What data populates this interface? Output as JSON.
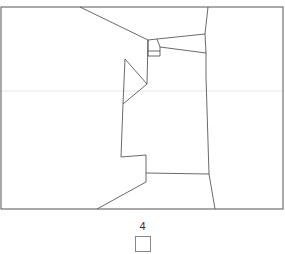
{
  "map": {
    "frame": {
      "x": 1,
      "y": 7,
      "width": 282,
      "height": 202
    },
    "stroke_color": "#444444",
    "gridline": {
      "y": 91,
      "color": "#e8e8e8"
    },
    "boundaries": [
      [
        [
          80,
          7
        ],
        [
          148,
          40
        ]
      ],
      [
        [
          148,
          40
        ],
        [
          157,
          39
        ],
        [
          205,
          34
        ]
      ],
      [
        [
          208,
          7
        ],
        [
          205,
          34
        ],
        [
          206,
          53
        ],
        [
          206,
          77
        ],
        [
          209,
          174
        ],
        [
          215,
          209
        ]
      ],
      [
        [
          157,
          39
        ],
        [
          160,
          47
        ],
        [
          160,
          56
        ],
        [
          148,
          56
        ],
        [
          148,
          40
        ]
      ],
      [
        [
          148,
          51
        ],
        [
          160,
          51
        ]
      ],
      [
        [
          160,
          47
        ],
        [
          206,
          53
        ]
      ],
      [
        [
          148,
          40
        ],
        [
          147,
          84
        ]
      ],
      [
        [
          125,
          59
        ],
        [
          147,
          84
        ],
        [
          123,
          104
        ],
        [
          125,
          59
        ]
      ],
      [
        [
          123,
          104
        ],
        [
          121,
          157
        ],
        [
          146,
          155
        ],
        [
          146,
          182
        ],
        [
          97,
          209
        ]
      ],
      [
        [
          146,
          173
        ],
        [
          209,
          174
        ]
      ]
    ]
  },
  "legend": {
    "label": "4",
    "swatch_color": "#ffffff"
  }
}
